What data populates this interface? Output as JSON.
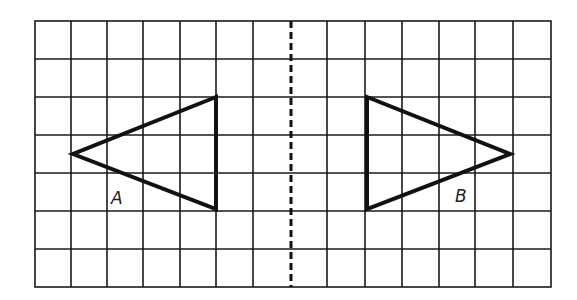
{
  "diagram": {
    "grid": {
      "columns": 14,
      "rows": 7,
      "line_color": "#1a1a1a"
    },
    "mirror_line": {
      "style": "dashed",
      "column_position": 7
    },
    "shapes": [
      {
        "id": "A",
        "label": "A",
        "type": "triangle",
        "vertices_grid": [
          [
            5,
            2
          ],
          [
            1,
            3.5
          ],
          [
            5,
            5
          ]
        ]
      },
      {
        "id": "B",
        "label": "B",
        "type": "triangle",
        "vertices_grid": [
          [
            9,
            2
          ],
          [
            13,
            3.5
          ],
          [
            9,
            5
          ]
        ]
      }
    ]
  }
}
